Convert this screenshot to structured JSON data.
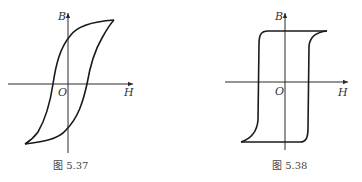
{
  "top_text_fragment": "……（截断的上一行文字）",
  "figures": [
    {
      "id": "fig-5-37",
      "caption": "图 5.37",
      "description": "Hysteresis loop (soft/narrow S-shaped) of a ferromagnetic material",
      "axes": {
        "x_label": "H",
        "y_label": "B",
        "origin_label": "O"
      }
    },
    {
      "id": "fig-5-38",
      "caption": "图 5.38",
      "description": "Rectangular hysteresis loop (square loop) of a ferromagnetic material",
      "axes": {
        "x_label": "H",
        "y_label": "B",
        "origin_label": "O"
      }
    }
  ],
  "colors": {
    "line": "#1a1a1a",
    "axis": "#2a2a2a",
    "text": "#333333",
    "background": "#ffffff"
  }
}
